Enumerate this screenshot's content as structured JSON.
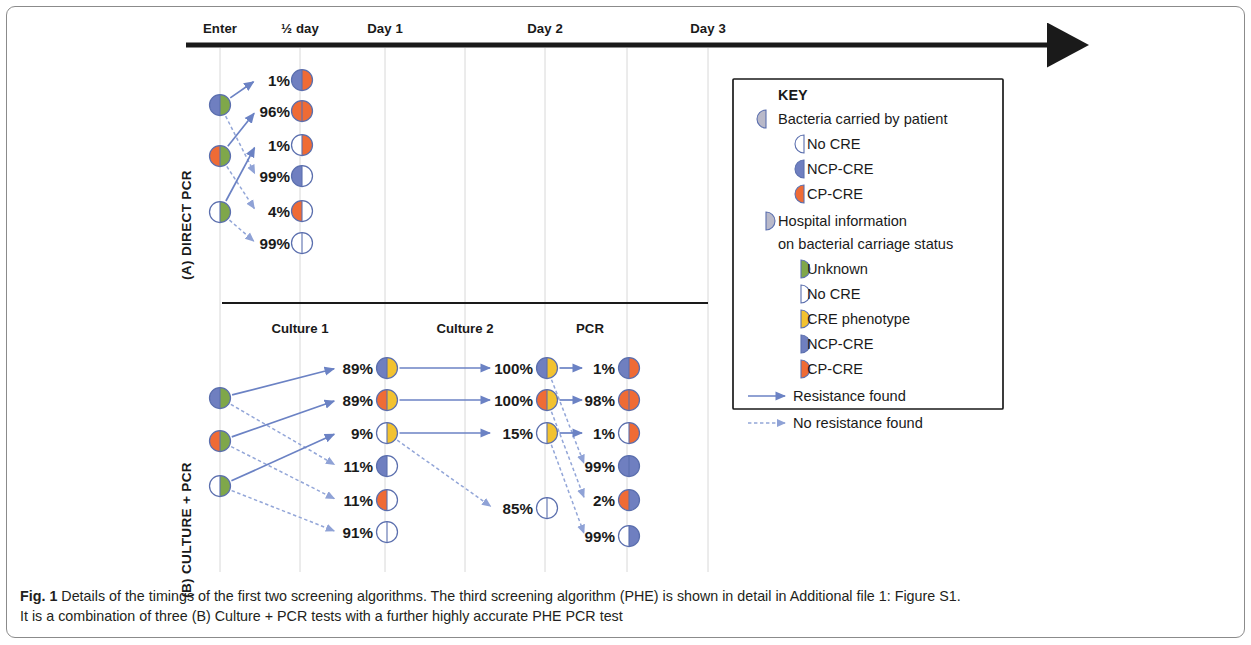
{
  "figure": {
    "caption_prefix": "Fig. 1",
    "caption_line1": "Details of the timings of the first two screening algorithms. The third screening algorithm (PHE) is shown in detail in Additional file 1: Figure S1.",
    "caption_line2": "It is a combination of three (B) Culture + PCR tests with a further highly accurate PHE PCR test"
  },
  "colors": {
    "unknown_green": "#7fa74a",
    "no_cre_white": "#ffffff",
    "cre_phenotype_yellow": "#f2c230",
    "ncp_cre_blue": "#6f7fc0",
    "cp_cre_red": "#ef6b35",
    "arrow_blue": "#6b82c4",
    "arrow_blue_light": "#93a6d8",
    "axis_black": "#1a1a1a",
    "gridline_grey": "#d8d8d8"
  },
  "timeline": {
    "labels": [
      "Enter",
      "½ day",
      "Day 1",
      "Day 2",
      "Day 3"
    ],
    "label_x": [
      220,
      300,
      385,
      545,
      708
    ],
    "axis_y": 45,
    "gridlines_x": [
      220,
      300,
      385,
      465,
      545,
      627,
      708
    ]
  },
  "panel_a": {
    "label": "(A) DIRECT PCR",
    "start_nodes": [
      {
        "pct": "",
        "left": "ncp_cre_blue",
        "right": "unknown_green",
        "y": 105
      },
      {
        "pct": "",
        "left": "cp_cre_red",
        "right": "unknown_green",
        "y": 156
      },
      {
        "pct": "",
        "left": "no_cre_white",
        "right": "unknown_green",
        "y": 212
      }
    ],
    "outcomes": [
      {
        "pct": "1%",
        "left": "ncp_cre_blue",
        "right": "cp_cre_red",
        "y": 80
      },
      {
        "pct": "96%",
        "left": "cp_cre_red",
        "right": "cp_cre_red",
        "y": 111
      },
      {
        "pct": "1%",
        "left": "no_cre_white",
        "right": "cp_cre_red",
        "y": 145
      },
      {
        "pct": "99%",
        "left": "ncp_cre_blue",
        "right": "no_cre_white",
        "y": 176
      },
      {
        "pct": "4%",
        "left": "cp_cre_red",
        "right": "no_cre_white",
        "y": 211
      },
      {
        "pct": "99%",
        "left": "no_cre_white",
        "right": "no_cre_white",
        "y": 243
      }
    ],
    "edges": [
      {
        "from": 0,
        "to": 0,
        "style": "solid"
      },
      {
        "from": 0,
        "to": 3,
        "style": "dashed"
      },
      {
        "from": 1,
        "to": 1,
        "style": "solid"
      },
      {
        "from": 1,
        "to": 4,
        "style": "dashed"
      },
      {
        "from": 2,
        "to": 2,
        "style": "solid"
      },
      {
        "from": 2,
        "to": 5,
        "style": "dashed"
      }
    ]
  },
  "panel_b": {
    "label": "(B) CULTURE + PCR",
    "column_headers": [
      "Culture 1",
      "Culture 2",
      "PCR"
    ],
    "column_header_x": [
      300,
      465,
      590
    ],
    "start_nodes": [
      {
        "left": "ncp_cre_blue",
        "right": "unknown_green",
        "y": 398
      },
      {
        "left": "cp_cre_red",
        "right": "unknown_green",
        "y": 441
      },
      {
        "left": "no_cre_white",
        "right": "unknown_green",
        "y": 486
      }
    ],
    "culture1": [
      {
        "pct": "89%",
        "left": "ncp_cre_blue",
        "right": "cre_phenotype_yellow",
        "y": 368
      },
      {
        "pct": "89%",
        "left": "cp_cre_red",
        "right": "cre_phenotype_yellow",
        "y": 400
      },
      {
        "pct": "9%",
        "left": "no_cre_white",
        "right": "cre_phenotype_yellow",
        "y": 433
      },
      {
        "pct": "11%",
        "left": "ncp_cre_blue",
        "right": "no_cre_white",
        "y": 466
      },
      {
        "pct": "11%",
        "left": "cp_cre_red",
        "right": "no_cre_white",
        "y": 500
      },
      {
        "pct": "91%",
        "left": "no_cre_white",
        "right": "no_cre_white",
        "y": 532
      }
    ],
    "culture2": [
      {
        "pct": "100%",
        "left": "ncp_cre_blue",
        "right": "cre_phenotype_yellow",
        "y": 368
      },
      {
        "pct": "100%",
        "left": "cp_cre_red",
        "right": "cre_phenotype_yellow",
        "y": 400
      },
      {
        "pct": "15%",
        "left": "no_cre_white",
        "right": "cre_phenotype_yellow",
        "y": 433
      },
      {
        "pct": "85%",
        "left": "no_cre_white",
        "right": "no_cre_white",
        "y": 508
      }
    ],
    "pcr": [
      {
        "pct": "1%",
        "left": "ncp_cre_blue",
        "right": "cp_cre_red",
        "y": 368
      },
      {
        "pct": "98%",
        "left": "cp_cre_red",
        "right": "cp_cre_red",
        "y": 400
      },
      {
        "pct": "1%",
        "left": "no_cre_white",
        "right": "cp_cre_red",
        "y": 433
      },
      {
        "pct": "99%",
        "left": "ncp_cre_blue",
        "right": "ncp_cre_blue",
        "y": 466
      },
      {
        "pct": "2%",
        "left": "cp_cre_red",
        "right": "ncp_cre_blue",
        "y": 500
      },
      {
        "pct": "99%",
        "left": "no_cre_white",
        "right": "ncp_cre_blue",
        "y": 536
      }
    ],
    "edges_start_to_c1": [
      {
        "from": 0,
        "to": 0,
        "style": "solid"
      },
      {
        "from": 0,
        "to": 3,
        "style": "dashed"
      },
      {
        "from": 1,
        "to": 1,
        "style": "solid"
      },
      {
        "from": 1,
        "to": 4,
        "style": "dashed"
      },
      {
        "from": 2,
        "to": 2,
        "style": "solid"
      },
      {
        "from": 2,
        "to": 5,
        "style": "dashed"
      }
    ],
    "edges_c1_to_c2": [
      {
        "from": 0,
        "to": 0,
        "style": "solid"
      },
      {
        "from": 1,
        "to": 1,
        "style": "solid"
      },
      {
        "from": 2,
        "to": 2,
        "style": "solid"
      },
      {
        "from": 2,
        "to": 3,
        "style": "dashed"
      }
    ],
    "edges_c2_to_pcr": [
      {
        "from": 0,
        "to": 0,
        "style": "solid"
      },
      {
        "from": 0,
        "to": 3,
        "style": "dashed"
      },
      {
        "from": 1,
        "to": 1,
        "style": "solid"
      },
      {
        "from": 1,
        "to": 4,
        "style": "dashed"
      },
      {
        "from": 2,
        "to": 2,
        "style": "solid"
      },
      {
        "from": 2,
        "to": 5,
        "style": "dashed"
      }
    ]
  },
  "key": {
    "title": "KEY",
    "section1_label": "Bacteria carried by patient",
    "section1_items": [
      {
        "label": "No CRE",
        "color": "no_cre_white"
      },
      {
        "label": "NCP-CRE",
        "color": "ncp_cre_blue"
      },
      {
        "label": "CP-CRE",
        "color": "cp_cre_red"
      }
    ],
    "section2_label_line1": "Hospital information",
    "section2_label_line2": "on bacterial carriage status",
    "section2_items": [
      {
        "label": "Unknown",
        "color": "unknown_green"
      },
      {
        "label": "No CRE",
        "color": "no_cre_white"
      },
      {
        "label": "CRE phenotype",
        "color": "cre_phenotype_yellow"
      },
      {
        "label": "NCP-CRE",
        "color": "ncp_cre_blue"
      },
      {
        "label": "CP-CRE",
        "color": "cp_cre_red"
      }
    ],
    "arrow_items": [
      {
        "label": "Resistance found",
        "style": "solid"
      },
      {
        "label": "No resistance found",
        "style": "dashed"
      }
    ]
  }
}
